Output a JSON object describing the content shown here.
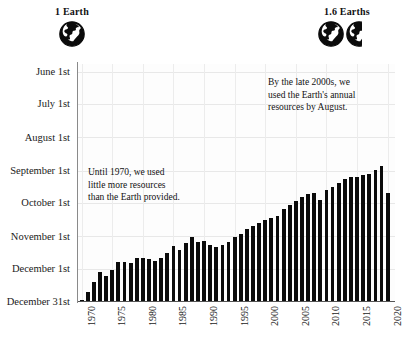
{
  "legend": {
    "left": {
      "label": "1 Earth",
      "icon": "globe-icon",
      "globes": 1
    },
    "right": {
      "label": "1.6 Earths",
      "icon": "globe-icon",
      "globes": 1.6
    }
  },
  "annotations": {
    "early": {
      "name": "annotation-until-1970",
      "lines": [
        "Until 1970, we used",
        "little more resources",
        "than the Earth provided."
      ]
    },
    "late": {
      "name": "annotation-late-2000s",
      "lines": [
        "By the late 2000s, we",
        "used the Earth's annual",
        "resources by August."
      ]
    }
  },
  "chart_data": {
    "type": "bar",
    "title": "",
    "subtitle": "",
    "xlabel": "",
    "ylabel": "",
    "grid": true,
    "legend_position": "top",
    "ytick_labels": [
      "June 1st",
      "July 1st",
      "August 1st",
      "September 1st",
      "October 1st",
      "November 1st",
      "December 1st",
      "December 31st"
    ],
    "ytick_values": [
      152,
      182,
      213,
      244,
      274,
      305,
      335,
      365
    ],
    "ylim": [
      365,
      145
    ],
    "xtick_labels": [
      "1970",
      "1975",
      "1980",
      "1985",
      "1990",
      "1995",
      "2000",
      "2005",
      "2010",
      "2015",
      "2020"
    ],
    "xtick_values": [
      1970,
      1975,
      1980,
      1985,
      1990,
      1995,
      2000,
      2005,
      2010,
      2015,
      2020
    ],
    "xlim": [
      1969.4,
      2021.2
    ],
    "bar_color": "#0b0b0b",
    "categories": [
      1970,
      1971,
      1972,
      1973,
      1974,
      1975,
      1976,
      1977,
      1978,
      1979,
      1980,
      1981,
      1982,
      1983,
      1984,
      1985,
      1986,
      1987,
      1988,
      1989,
      1990,
      1991,
      1992,
      1993,
      1994,
      1995,
      1996,
      1997,
      1998,
      1999,
      2000,
      2001,
      2002,
      2003,
      2004,
      2005,
      2006,
      2007,
      2008,
      2009,
      2010,
      2011,
      2012,
      2013,
      2014,
      2015,
      2016,
      2017,
      2018,
      2019,
      2020
    ],
    "values": [
      364,
      357,
      347,
      338,
      342,
      336,
      329,
      329,
      330,
      325,
      325,
      326,
      328,
      325,
      320,
      314,
      318,
      311,
      306,
      310,
      309,
      313,
      315,
      313,
      310,
      306,
      303,
      298,
      295,
      293,
      290,
      288,
      286,
      280,
      276,
      272,
      268,
      266,
      265,
      271,
      262,
      259,
      255,
      252,
      250,
      250,
      248,
      247,
      243,
      240,
      265
    ],
    "value_unit": "day-of-year of Earth Overshoot Day",
    "series_name": "Earth Overshoot Day"
  }
}
